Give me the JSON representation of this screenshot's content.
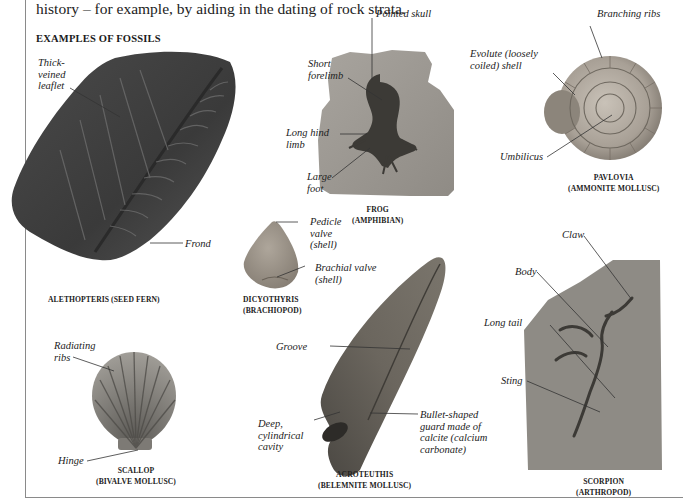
{
  "intro_text": "history – for example, by aiding in the dating of rock strata.",
  "section_heading": "EXAMPLES OF FOSSILS",
  "fossils": [
    {
      "id": "alethopteris",
      "caption": [
        "ALETHOPTERIS (SEED FERN)"
      ],
      "labels": [
        "Thick-",
        "veined",
        "leaflet",
        "Frond"
      ]
    },
    {
      "id": "frog",
      "caption": [
        "FROG",
        "(AMPHIBIAN)"
      ],
      "labels": [
        "Pointed skull",
        "Short",
        "forelimb",
        "Long hind",
        "limb",
        "Large",
        "foot"
      ]
    },
    {
      "id": "pavlovia",
      "caption": [
        "PAVLOVIA",
        "(AMMONITE MOLLUSC)"
      ],
      "labels": [
        "Branching ribs",
        "Evolute (loosely",
        "coiled) shell",
        "Umbilicus"
      ]
    },
    {
      "id": "dicyothyris",
      "caption": [
        "DICYOTHYRIS",
        "(BRACHIOPOD)"
      ],
      "labels": [
        "Pedicle",
        "valve",
        "(shell)",
        "Brachial valve",
        "(shell)"
      ]
    },
    {
      "id": "scorpion",
      "caption": [
        "SCORPION",
        "(ARTHROPOD)"
      ],
      "labels": [
        "Claw",
        "Body",
        "Long tail",
        "Sting"
      ]
    },
    {
      "id": "scallop",
      "caption": [
        "SCALLOP",
        "(BIVALVE MOLLUSC)"
      ],
      "labels": [
        "Radiating",
        "ribs",
        "Hinge"
      ]
    },
    {
      "id": "acroteuthis",
      "caption": [
        "ACROTEUTHIS",
        "(BELEMNITE MOLLUSC)"
      ],
      "labels": [
        "Groove",
        "Deep,",
        "cylindrical",
        "cavity",
        "Bullet-shaped",
        "guard made of",
        "calcite (calcium",
        "carbonate)"
      ]
    }
  ]
}
